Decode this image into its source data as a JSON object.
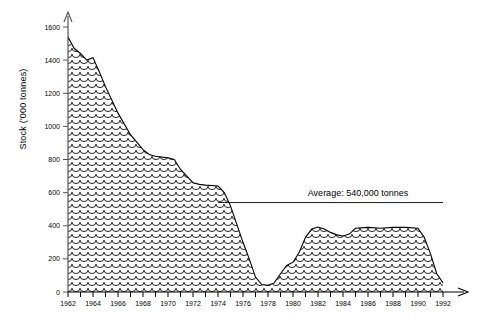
{
  "chart_data": {
    "type": "area",
    "title": "",
    "xlabel": "",
    "ylabel": "Stock ('000 tonnes)",
    "ylim": [
      0,
      1600
    ],
    "xlim": [
      1962,
      1992
    ],
    "ytick_step": 200,
    "yticks": [
      0,
      200,
      400,
      600,
      800,
      1000,
      1200,
      1400,
      1600
    ],
    "xticks_labeled": [
      1962,
      1964,
      1966,
      1968,
      1970,
      1972,
      1974,
      1976,
      1978,
      1980,
      1982,
      1984,
      1986,
      1988,
      1990,
      1992
    ],
    "xtick_minor_every": 1,
    "grid": false,
    "legend": null,
    "fill_pattern": "fish-scale",
    "line_color": "#000000",
    "fill_color": "#ffffff",
    "x": [
      1962,
      1962.5,
      1963,
      1963.5,
      1964,
      1964.5,
      1965,
      1966,
      1967,
      1968,
      1968.5,
      1969,
      1970,
      1970.5,
      1971,
      1972,
      1972.5,
      1973,
      1974,
      1974.5,
      1975,
      1976,
      1976.5,
      1977,
      1977.5,
      1978,
      1978.5,
      1979,
      1979.5,
      1980,
      1980.5,
      1981,
      1981.5,
      1982,
      1982.5,
      1983,
      1983.5,
      1984,
      1984.5,
      1985,
      1986,
      1987,
      1988,
      1989,
      1990,
      1990.5,
      1991,
      1991.5,
      1992
    ],
    "values": [
      1540,
      1470,
      1440,
      1400,
      1415,
      1330,
      1240,
      1080,
      950,
      860,
      830,
      820,
      810,
      800,
      740,
      660,
      650,
      645,
      640,
      600,
      520,
      300,
      200,
      90,
      45,
      40,
      55,
      110,
      160,
      180,
      240,
      330,
      380,
      392,
      380,
      360,
      345,
      338,
      350,
      385,
      390,
      385,
      390,
      390,
      385,
      330,
      230,
      110,
      55
    ],
    "annotations": [
      {
        "type": "horizontal-line-with-label",
        "label": "Average: 540,000 tonnes",
        "value": 540,
        "x_start": 1974,
        "x_end": 1992,
        "label_anchor_x": 1985.2
      }
    ]
  },
  "axis": {
    "y_arrow": true,
    "x_arrow": true
  }
}
